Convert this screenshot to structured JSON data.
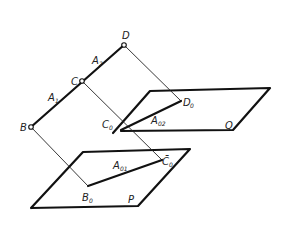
{
  "diagram": {
    "type": "descriptive-geometry projection",
    "points": {
      "D": {
        "label": "D",
        "x": 124,
        "y": 45
      },
      "C": {
        "label": "C",
        "x": 82,
        "y": 81
      },
      "B": {
        "label": "B",
        "x": 31,
        "y": 127
      },
      "D0": {
        "label": "D",
        "sub": "0",
        "x": 181,
        "y": 101
      },
      "C0": {
        "label": "C",
        "sub": "0",
        "x": 121,
        "y": 130
      },
      "C0bar": {
        "label": "C̄",
        "sub": "0",
        "x": 162,
        "y": 160
      },
      "B0": {
        "label": "B",
        "sub": "0",
        "x": 88,
        "y": 186
      }
    },
    "segments": {
      "A1": {
        "label": "A",
        "sub": "1"
      },
      "A2": {
        "label": "A",
        "sub": "2"
      },
      "A02": {
        "label": "A",
        "sub": "02"
      },
      "A01": {
        "label": "A",
        "sub": "01"
      }
    },
    "planes": {
      "Q": {
        "label": "Q"
      },
      "P": {
        "label": "P"
      }
    }
  }
}
